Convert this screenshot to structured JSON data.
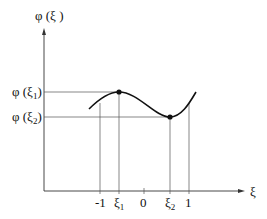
{
  "diagram": {
    "y_axis_label": "φ (ξ )",
    "x_axis_label": "ξ",
    "y_ticks": [
      {
        "base": "φ (ξ",
        "sub": "1",
        "close": ")"
      },
      {
        "base": "φ (ξ",
        "sub": "2",
        "close": ")"
      }
    ],
    "x_ticks": [
      {
        "label": "-1",
        "sub": ""
      },
      {
        "label": "ξ",
        "sub": "1"
      },
      {
        "label": "0",
        "sub": ""
      },
      {
        "label": "ξ",
        "sub": "2"
      },
      {
        "label": "1",
        "sub": ""
      }
    ],
    "points": [
      "local maximum at ξ1",
      "local minimum at ξ2"
    ]
  }
}
